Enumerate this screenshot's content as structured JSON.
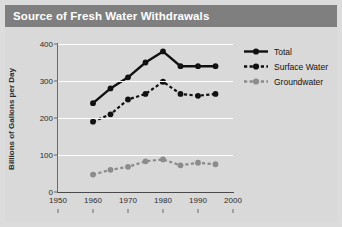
{
  "title": "Source of Fresh Water Withdrawals",
  "legend": {
    "position": "top-right",
    "entries": [
      {
        "label": "Total",
        "icon": "solid-line-marker-icon"
      },
      {
        "label": "Surface Water",
        "icon": "dashed-line-marker-icon"
      },
      {
        "label": "Groundwater",
        "icon": "dashed-gray-line-marker-icon"
      }
    ]
  },
  "colors": {
    "title_bar": "#7f7f7f",
    "title_text": "#ffffff",
    "panel": "#d9d9d9",
    "gridline": "#ffffff",
    "total": "#111111",
    "surface_water": "#111111",
    "groundwater": "#8c8c8c",
    "axis": "#4a4a4a"
  },
  "chart_data": {
    "type": "line",
    "title": "Source of Fresh Water Withdrawals",
    "xlabel": "",
    "ylabel": "Billions of Gallons per Day",
    "xlim": [
      1950,
      2000
    ],
    "ylim": [
      0,
      400
    ],
    "xticks": [
      1950,
      1960,
      1970,
      1980,
      1990,
      2000
    ],
    "yticks": [
      0,
      100,
      200,
      300,
      400
    ],
    "grid": true,
    "x": [
      1960,
      1965,
      1970,
      1975,
      1980,
      1985,
      1990,
      1995
    ],
    "series": [
      {
        "name": "Total",
        "style": "solid",
        "color": "#111111",
        "values": [
          240,
          280,
          310,
          350,
          380,
          340,
          340,
          340
        ]
      },
      {
        "name": "Surface Water",
        "style": "dashed",
        "color": "#111111",
        "values": [
          190,
          210,
          250,
          265,
          298,
          265,
          260,
          265
        ]
      },
      {
        "name": "Groundwater",
        "style": "dashed",
        "color": "#8c8c8c",
        "values": [
          47,
          60,
          68,
          83,
          88,
          72,
          79,
          75
        ]
      }
    ]
  }
}
